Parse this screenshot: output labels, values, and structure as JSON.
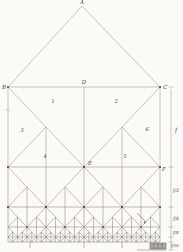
{
  "figure": {
    "type": "hierarchical-fractal-truss-diagram",
    "colors": {
      "paper": "#fbfaf7",
      "roof_line": "#bdb8b0",
      "tier_strokes": [
        "#b2aca3",
        "#a39c93",
        "#948d84",
        "#857f77",
        "#78726b"
      ],
      "bottom_chord": "#78726b",
      "node_dot": "#4d4a45",
      "text": "#45413c",
      "dimension_line": "#9b958c",
      "annotation": "#6b665f"
    },
    "canvas": {
      "width": 183,
      "height": 252
    },
    "frame": {
      "x_left": 8,
      "x_right": 160,
      "apex": {
        "x": 82,
        "y": 6
      },
      "top_chord_y": 87,
      "bottom_chord_y": 242
    },
    "tiers": [
      {
        "y": 87,
        "h": 80,
        "modules": 1,
        "detail": true,
        "dots": true
      },
      {
        "y": 167,
        "h": 40,
        "modules": 2,
        "detail": true,
        "dots": true
      },
      {
        "y": 207,
        "h": 20,
        "modules": 4,
        "detail": true,
        "dots": true
      },
      {
        "y": 227,
        "h": 10,
        "modules": 8,
        "detail": true,
        "dots": false
      },
      {
        "y": 237,
        "h": 5,
        "modules": 16,
        "detail": false,
        "dots": false
      }
    ],
    "node_labels": [
      {
        "id": "A",
        "text": "A",
        "x": 82,
        "y": 4,
        "anchor": "middle",
        "size": 5.5
      },
      {
        "id": "B",
        "text": "B",
        "x": 6,
        "y": 89,
        "anchor": "end",
        "size": 5.5
      },
      {
        "id": "C",
        "text": "C",
        "x": 163,
        "y": 89,
        "anchor": "start",
        "size": 5.5
      },
      {
        "id": "D",
        "text": "D",
        "x": 84,
        "y": 84,
        "anchor": "middle",
        "size": 5.5
      },
      {
        "id": "E",
        "text": "E",
        "x": 88,
        "y": 165,
        "anchor": "start",
        "size": 5.5
      },
      {
        "id": "F",
        "text": "F",
        "x": 162,
        "y": 171,
        "anchor": "start",
        "size": 5.0
      }
    ],
    "panel_labels": [
      {
        "id": "1",
        "text": "1",
        "x": 53,
        "y": 103,
        "size": 5
      },
      {
        "id": "2",
        "text": "2",
        "x": 116,
        "y": 103,
        "size": 5
      },
      {
        "id": "3",
        "text": "3",
        "x": 22,
        "y": 132,
        "size": 5
      },
      {
        "id": "6",
        "text": "6",
        "x": 147,
        "y": 131,
        "size": 5
      },
      {
        "id": "4",
        "text": "4",
        "x": 45,
        "y": 158,
        "size": 5
      },
      {
        "id": "5",
        "text": "5",
        "x": 125,
        "y": 158,
        "size": 5
      }
    ],
    "dimension": {
      "line_x": 171,
      "y_top": 89,
      "y_bottom": 250,
      "tick_ys": [
        87,
        167,
        207,
        227,
        237,
        242,
        250
      ],
      "labels": [
        {
          "id": "f",
          "text": "f",
          "x": 175,
          "y": 132,
          "size": 5.5
        },
        {
          "id": "f2",
          "text": "f/2",
          "x": 173,
          "y": 192,
          "size": 4.6
        },
        {
          "id": "f4",
          "text": "f/4",
          "x": 173,
          "y": 220,
          "size": 4.4
        },
        {
          "id": "f8",
          "text": "f/8",
          "x": 173,
          "y": 234,
          "size": 4.2
        },
        {
          "id": "f16",
          "text": "f/16",
          "x": 171,
          "y": 247,
          "size": 4.0
        }
      ]
    },
    "annotations": {
      "detail_arrow": {
        "x1": 137,
        "y1": 213,
        "x2": 146,
        "y2": 222
      },
      "detail_block": {
        "x0": 150,
        "x1": 166,
        "y": 243,
        "h": 6,
        "modules": 4
      },
      "bracket": {
        "x0": 137,
        "x1": 166,
        "y": 250
      },
      "descender_xs": [
        30,
        84,
        122
      ],
      "descender_y1": 242,
      "descender_y2": 248,
      "edge_tick": {
        "x0": 5,
        "x1": 10,
        "y": 110
      }
    }
  }
}
